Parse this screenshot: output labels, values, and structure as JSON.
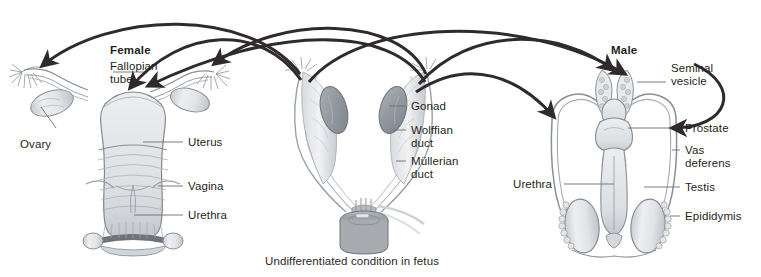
{
  "figure": {
    "title_female": "Female",
    "title_male": "Male",
    "caption": "Undifferentiated condition in fetus",
    "background_color": "#ffffff",
    "ink_color": "#231f20",
    "arrow_color": "#2f2b2c",
    "leader_color": "#58595b",
    "organ_fill": "#e9eaec",
    "organ_shade": "#b9bcc0",
    "gonad_fill": "#9aa0a6"
  },
  "panels": {
    "female": {
      "name": "Female",
      "labels": [
        {
          "id": "fallopian-tube",
          "text": "Fallopian\ntube",
          "line1": "Fallopian",
          "line2": "tube"
        },
        {
          "id": "ovary",
          "text": "Ovary"
        },
        {
          "id": "uterus",
          "text": "Uterus"
        },
        {
          "id": "vagina",
          "text": "Vagina"
        },
        {
          "id": "urethra",
          "text": "Urethra"
        }
      ]
    },
    "undifferentiated": {
      "name": "Undifferentiated condition in fetus",
      "labels": [
        {
          "id": "gonad",
          "text": "Gonad"
        },
        {
          "id": "wolffian-duct",
          "line1": "Wolffian",
          "line2": "duct"
        },
        {
          "id": "mullerian-duct",
          "line1": "Müllerian",
          "line2": "duct"
        }
      ]
    },
    "male": {
      "name": "Male",
      "labels": [
        {
          "id": "seminal-vesicle",
          "line1": "Seminal",
          "line2": "vesicle"
        },
        {
          "id": "prostate",
          "text": "Prostate"
        },
        {
          "id": "vas-deferens",
          "line1": "Vas",
          "line2": "deferens"
        },
        {
          "id": "testis",
          "text": "Testis"
        },
        {
          "id": "epididymis",
          "text": "Epididymis"
        },
        {
          "id": "urethra",
          "text": "Urethra"
        }
      ]
    }
  },
  "labels_flat": {
    "female_title": "Female",
    "fallopian_l1": "Fallopian",
    "fallopian_l2": "tube",
    "ovary": "Ovary",
    "uterus": "Uterus",
    "vagina": "Vagina",
    "urethra_female": "Urethra",
    "gonad": "Gonad",
    "wolffian_l1": "Wolffian",
    "wolffian_l2": "duct",
    "mullerian_l1": "Müllerian",
    "mullerian_l2": "duct",
    "caption": "Undifferentiated condition in fetus",
    "male_title": "Male",
    "seminal_l1": "Seminal",
    "seminal_l2": "vesicle",
    "prostate": "Prostate",
    "vas_l1": "Vas",
    "vas_l2": "deferens",
    "testis": "Testis",
    "epididymis": "Epididymis",
    "urethra_male": "Urethra"
  },
  "arrows": {
    "description": "Curved derivation arrows from the undifferentiated fetal structures to the female and male adult homologues",
    "count": 6
  }
}
